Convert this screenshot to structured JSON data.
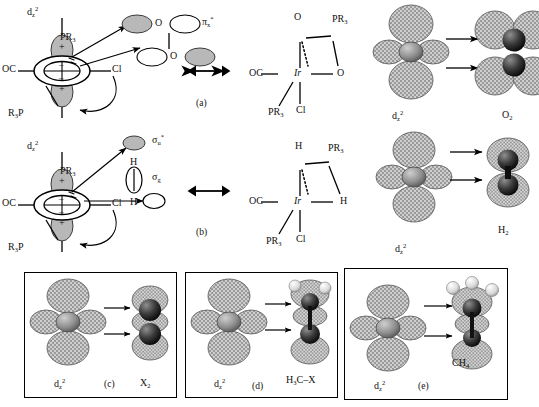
{
  "figure": {
    "type": "chemistry-orbital-diagram",
    "background": "#ffffff",
    "ink": "#111111",
    "lobe_shaded": "#b3b3b3",
    "lobe_white": "#ffffff"
  },
  "panels": [
    {
      "id": "a",
      "tag": "(a)",
      "left_scheme": {
        "orbital_label": "d",
        "orbital_sub": "z",
        "orbital_sup": "2",
        "ligands": {
          "top_phosphine": "PR3",
          "left_carbonyl": "OC",
          "right_chloride": "Cl",
          "bottom_phosphine": "R3P"
        },
        "lobe_signs": [
          "+",
          "-",
          "-",
          "+"
        ],
        "substrate_atoms": [
          "O",
          "O"
        ],
        "substrate_orbital_label": "px*",
        "substrate_name": "O2"
      },
      "right_structure": {
        "metal": "Ir",
        "ligands": [
          "O",
          "PR3",
          "OC",
          "O",
          "PR3",
          "Cl"
        ]
      }
    },
    {
      "id": "b",
      "tag": "(b)",
      "left_scheme": {
        "orbital_label": "d",
        "orbital_sub": "z",
        "orbital_sup": "2",
        "ligands": {
          "top_phosphine": "PR3",
          "left_carbonyl": "OC",
          "right_chloride": "Cl",
          "bottom_phosphine": "R3P"
        },
        "lobe_signs": [
          "+",
          "-",
          "-",
          "+"
        ],
        "substrate_atoms": [
          "H",
          "H"
        ],
        "substrate_orbital_antibonding": "su*",
        "substrate_orbital_bonding": "sg",
        "substrate_name": "H2"
      },
      "right_structure": {
        "metal": "Ir",
        "ligands": [
          "H",
          "PR3",
          "OC",
          "H",
          "PR3",
          "Cl"
        ]
      }
    }
  ],
  "orbital_pairs": [
    {
      "id": "o2",
      "source_label": "dz2",
      "target_label": "O2",
      "boxed": false,
      "tag": ""
    },
    {
      "id": "h2",
      "source_label": "dz2",
      "target_label": "H2",
      "boxed": false,
      "tag": ""
    },
    {
      "id": "x2",
      "source_label": "dz2",
      "target_label": "X2",
      "boxed": true,
      "tag": "(c)"
    },
    {
      "id": "h3cx",
      "source_label": "dz2",
      "target_label": "H3C-X",
      "boxed": true,
      "tag": "(d)"
    },
    {
      "id": "ch4",
      "source_label": "dz2",
      "target_label": "CH4",
      "boxed": true,
      "tag": "(e)"
    }
  ],
  "labels": {
    "dz2_plain": "d",
    "dz2_sub": "z",
    "dz2_sup": "2",
    "O": "O",
    "H": "H",
    "Ir": "Ir",
    "Cl": "Cl",
    "OC": "OC",
    "PR3_p": "PR",
    "PR3_sub": "3",
    "R3P_r": "R",
    "R3P_sub": "3",
    "R3P_p": "P",
    "pi_x_star_p": "π",
    "pi_x_star_sub": "x",
    "pi_x_star_sup": "*",
    "sigma_u_star_s": "σ",
    "sigma_u_star_sub": "u",
    "sigma_u_star_sup": "*",
    "sigma_g_s": "σ",
    "sigma_g_sub": "g",
    "plus": "+",
    "minus": "–",
    "O2_main": "O",
    "O2_sub": "2",
    "H2_main": "H",
    "H2_sub": "2",
    "X2_main": "X",
    "X2_sub": "2",
    "H3CX_h": "H",
    "H3CX_sub": "3",
    "H3CX_cx": "C–X",
    "CH4_main": "CH",
    "CH4_sub": "4",
    "tag_a": "(a)",
    "tag_b": "(b)",
    "tag_c": "(c)",
    "tag_d": "(d)",
    "tag_e": "(e)"
  }
}
